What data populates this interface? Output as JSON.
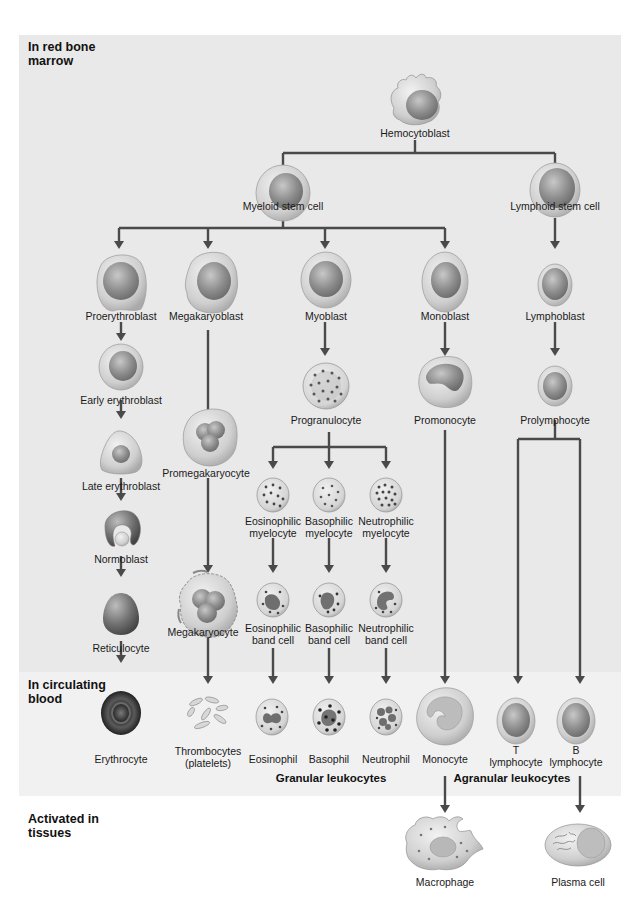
{
  "zones": {
    "marrow": "In red bone marrow",
    "marrow_line1": "In red bone",
    "marrow_line2": "marrow",
    "blood_line1": "In circulating",
    "blood_line2": "blood",
    "tissue_line1": "Activated in",
    "tissue_line2": "tissues"
  },
  "cells": {
    "hemocytoblast": "Hemocytoblast",
    "myeloid_stem": "Myeloid stem cell",
    "lymphoid_stem": "Lymphoid stem cell",
    "proerythroblast": "Proerythroblast",
    "megakaryoblast": "Megakaryoblast",
    "myoblast": "Myoblast",
    "monoblast": "Monoblast",
    "lymphoblast": "Lymphoblast",
    "early_erythroblast": "Early erythroblast",
    "progranulocyte": "Progranulocyte",
    "promonocyte": "Promonocyte",
    "prolymphocyte": "Prolymphocyte",
    "late_erythroblast": "Late erythroblast",
    "promegakaryocyte": "Promegakaryocyte",
    "eos_myelocyte_1": "Eosinophilic",
    "eos_myelocyte_2": "myelocyte",
    "baso_myelocyte_1": "Basophilic",
    "baso_myelocyte_2": "myelocyte",
    "neut_myelocyte_1": "Neutrophilic",
    "neut_myelocyte_2": "myelocyte",
    "normoblast": "Normoblast",
    "megakaryocyte": "Megakaryocyte",
    "eos_band_1": "Eosinophilic",
    "eos_band_2": "band cell",
    "baso_band_1": "Basophilic",
    "baso_band_2": "band cell",
    "neut_band_1": "Neutrophilic",
    "neut_band_2": "band cell",
    "reticulocyte": "Reticulocyte",
    "erythrocyte": "Erythrocyte",
    "thrombocytes_1": "Thrombocytes",
    "thrombocytes_2": "(platelets)",
    "eosinophil": "Eosinophil",
    "basophil": "Basophil",
    "neutrophil": "Neutrophil",
    "monocyte": "Monocyte",
    "t_lymph_1": "T",
    "t_lymph_2": "lymphocyte",
    "b_lymph_1": "B",
    "b_lymph_2": "lymphocyte",
    "macrophage": "Macrophage",
    "plasma_cell": "Plasma cell"
  },
  "groups": {
    "granular": "Granular leukocytes",
    "agranular": "Agranular leukocytes"
  },
  "colors": {
    "marrow_bg": "#e9e9e9",
    "blood_bg": "#f1f1f1",
    "arrow": "#4a4a4a",
    "cell_body": "#cfcfcf",
    "nucleus": "#8a8a8a"
  }
}
